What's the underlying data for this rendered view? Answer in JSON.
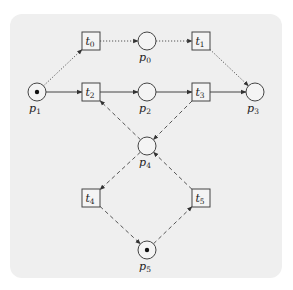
{
  "diagram": {
    "type": "petri-net",
    "colors": {
      "background": "#ffffff",
      "panel": "#efefef",
      "stroke": "#444444",
      "token": "#111111"
    },
    "places": [
      {
        "id": "p0",
        "label": "p",
        "sub": "0",
        "x": 147,
        "y": 41,
        "tokens": 0
      },
      {
        "id": "p1",
        "label": "p",
        "sub": "1",
        "x": 37,
        "y": 92,
        "tokens": 1
      },
      {
        "id": "p2",
        "label": "p",
        "sub": "2",
        "x": 147,
        "y": 92,
        "tokens": 0
      },
      {
        "id": "p3",
        "label": "p",
        "sub": "3",
        "x": 255,
        "y": 92,
        "tokens": 0
      },
      {
        "id": "p4",
        "label": "p",
        "sub": "4",
        "x": 147,
        "y": 146,
        "tokens": 0
      },
      {
        "id": "p5",
        "label": "p",
        "sub": "5",
        "x": 147,
        "y": 250,
        "tokens": 1
      }
    ],
    "transitions": [
      {
        "id": "t0",
        "label": "t",
        "sub": "0",
        "x": 91,
        "y": 41
      },
      {
        "id": "t1",
        "label": "t",
        "sub": "1",
        "x": 201,
        "y": 41
      },
      {
        "id": "t2",
        "label": "t",
        "sub": "2",
        "x": 91,
        "y": 92
      },
      {
        "id": "t3",
        "label": "t",
        "sub": "3",
        "x": 201,
        "y": 92
      },
      {
        "id": "t4",
        "label": "t",
        "sub": "4",
        "x": 91,
        "y": 198
      },
      {
        "id": "t5",
        "label": "t",
        "sub": "5",
        "x": 201,
        "y": 198
      }
    ],
    "arcs": [
      {
        "from": "p1",
        "to": "t0",
        "style": "dotted"
      },
      {
        "from": "t0",
        "to": "p0",
        "style": "dotted"
      },
      {
        "from": "p0",
        "to": "t1",
        "style": "dotted"
      },
      {
        "from": "t1",
        "to": "p3",
        "style": "dotted"
      },
      {
        "from": "p1",
        "to": "t2",
        "style": "solid"
      },
      {
        "from": "t2",
        "to": "p2",
        "style": "solid"
      },
      {
        "from": "p2",
        "to": "t3",
        "style": "solid"
      },
      {
        "from": "t3",
        "to": "p3",
        "style": "solid"
      },
      {
        "from": "p4",
        "to": "t2",
        "style": "dashed"
      },
      {
        "from": "t3",
        "to": "p4",
        "style": "dashed"
      },
      {
        "from": "p4",
        "to": "t4",
        "style": "dashed"
      },
      {
        "from": "t4",
        "to": "p5",
        "style": "dashed"
      },
      {
        "from": "p5",
        "to": "t5",
        "style": "dashed"
      },
      {
        "from": "t5",
        "to": "p4",
        "style": "dashed"
      }
    ]
  }
}
